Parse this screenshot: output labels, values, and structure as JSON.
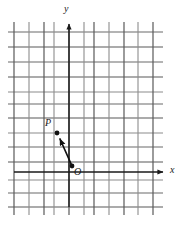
{
  "figure": {
    "kind": "grid-vector-diagram",
    "width": 177,
    "height": 225,
    "background_color": "#ffffff"
  },
  "grid": {
    "line_color": "#5a5a5a",
    "alt_line_color": "#8c8c8c",
    "spacing_px": 15,
    "vertical_lines_x": [
      14,
      29,
      44,
      54,
      69,
      84,
      94,
      109,
      124,
      138,
      153
    ],
    "horizontal_lines_y": [
      32,
      47,
      62,
      77,
      92,
      107,
      122,
      133,
      147,
      162,
      177,
      192,
      207
    ],
    "horizontal_extent_x": [
      8,
      163
    ],
    "vertical_extent_y": [
      22,
      215
    ]
  },
  "axes": {
    "y_axis": {
      "label": "y",
      "x_px": 69,
      "arrow_tip_y_px": 21,
      "color": "#1a1a1a"
    },
    "x_axis": {
      "label": "x",
      "y_px": 172,
      "arrow_tip_x_px": 168,
      "color": "#1a1a1a"
    }
  },
  "points": [
    {
      "name": "P",
      "label": "P",
      "x_px": 57,
      "y_px": 133,
      "radius_px": 2.4,
      "color": "#111111"
    },
    {
      "name": "O",
      "label": "O",
      "x_px": 72,
      "y_px": 166,
      "radius_px": 2.4,
      "color": "#111111"
    }
  ],
  "vector": {
    "name": "OP",
    "from_point": "O",
    "to_point": "P",
    "from_x_px": 72,
    "from_y_px": 166,
    "to_x_px": 57,
    "to_y_px": 133,
    "color": "#111111",
    "stroke_width_px": 1.6,
    "arrowhead": "filled-triangle"
  }
}
